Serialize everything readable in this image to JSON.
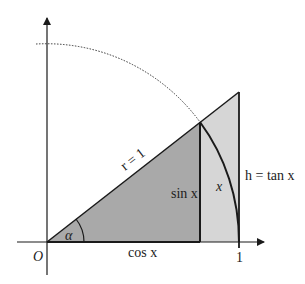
{
  "diagram": {
    "labels": {
      "origin": "O",
      "one": "1",
      "radius": "r = 1",
      "angle": "α",
      "sin": "sin x",
      "cos": "cos x",
      "arc": "x",
      "tan": "h = tan x"
    },
    "colors": {
      "dark_fill": "#a9a9a9",
      "light_fill": "#d6d6d6",
      "stroke": "#1a1a1a"
    }
  }
}
